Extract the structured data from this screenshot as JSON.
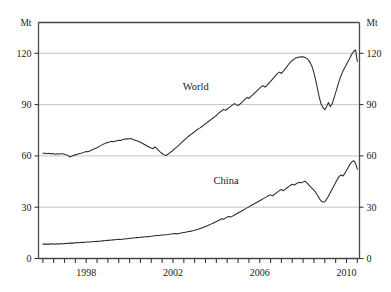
{
  "chart_data": {
    "type": "line",
    "title": "",
    "xlabel": "",
    "ylabel": "Mt",
    "unit_label_left": "Mt",
    "unit_label_right": "Mt",
    "grid": true,
    "legend": "inline-labels",
    "xlim": [
      1995.8,
      2010.6
    ],
    "ylim": [
      0,
      138
    ],
    "yticks": [
      0,
      30,
      60,
      90,
      120
    ],
    "ytick_labels": [
      "0",
      "30",
      "60",
      "90",
      "120"
    ],
    "xticks": [
      1996,
      1996.5,
      1997,
      1997.5,
      1998,
      1998.5,
      1999,
      1999.5,
      2000,
      2000.5,
      2001,
      2001.5,
      2002,
      2002.5,
      2003,
      2003.5,
      2004,
      2004.5,
      2005,
      2005.5,
      2006,
      2006.5,
      2007,
      2007.5,
      2008,
      2008.5,
      2009,
      2009.5,
      2010,
      2010.5
    ],
    "xtick_labels_shown": [
      "1998",
      "2002",
      "2006",
      "2010"
    ],
    "xtick_label_positions": [
      1998,
      2002,
      2006,
      2010
    ],
    "series": [
      {
        "name": "World",
        "label": "World",
        "label_x": 2003.05,
        "label_y": 98.5,
        "color": "#2b2b2b",
        "x": [
          1996.0,
          1996.083,
          1996.167,
          1996.25,
          1996.333,
          1996.417,
          1996.5,
          1996.583,
          1996.667,
          1996.75,
          1996.833,
          1996.917,
          1997.0,
          1997.083,
          1997.167,
          1997.25,
          1997.333,
          1997.417,
          1997.5,
          1997.583,
          1997.667,
          1997.75,
          1997.833,
          1997.917,
          1998.0,
          1998.083,
          1998.167,
          1998.25,
          1998.333,
          1998.417,
          1998.5,
          1998.583,
          1998.667,
          1998.75,
          1998.833,
          1998.917,
          1999.0,
          1999.083,
          1999.167,
          1999.25,
          1999.333,
          1999.417,
          1999.5,
          1999.583,
          1999.667,
          1999.75,
          1999.833,
          1999.917,
          2000.0,
          2000.083,
          2000.167,
          2000.25,
          2000.333,
          2000.417,
          2000.5,
          2000.583,
          2000.667,
          2000.75,
          2000.833,
          2000.917,
          2001.0,
          2001.083,
          2001.167,
          2001.25,
          2001.333,
          2001.417,
          2001.5,
          2001.583,
          2001.667,
          2001.75,
          2001.833,
          2001.917,
          2002.0,
          2002.083,
          2002.167,
          2002.25,
          2002.333,
          2002.417,
          2002.5,
          2002.583,
          2002.667,
          2002.75,
          2002.833,
          2002.917,
          2003.0,
          2003.083,
          2003.167,
          2003.25,
          2003.333,
          2003.417,
          2003.5,
          2003.583,
          2003.667,
          2003.75,
          2003.833,
          2003.917,
          2004.0,
          2004.083,
          2004.167,
          2004.25,
          2004.333,
          2004.417,
          2004.5,
          2004.583,
          2004.667,
          2004.75,
          2004.833,
          2004.917,
          2005.0,
          2005.083,
          2005.167,
          2005.25,
          2005.333,
          2005.417,
          2005.5,
          2005.583,
          2005.667,
          2005.75,
          2005.833,
          2005.917,
          2006.0,
          2006.083,
          2006.167,
          2006.25,
          2006.333,
          2006.417,
          2006.5,
          2006.583,
          2006.667,
          2006.75,
          2006.833,
          2006.917,
          2007.0,
          2007.083,
          2007.167,
          2007.25,
          2007.333,
          2007.417,
          2007.5,
          2007.583,
          2007.667,
          2007.75,
          2007.833,
          2007.917,
          2008.0,
          2008.083,
          2008.167,
          2008.25,
          2008.333,
          2008.417,
          2008.5,
          2008.583,
          2008.667,
          2008.75,
          2008.833,
          2008.917,
          2009.0,
          2009.083,
          2009.167,
          2009.25,
          2009.333,
          2009.417,
          2009.5,
          2009.583,
          2009.667,
          2009.75,
          2009.833,
          2009.917,
          2010.0,
          2010.083,
          2010.167,
          2010.25,
          2010.333,
          2010.417,
          2010.5
        ],
        "values": [
          61.5,
          61.6,
          61.3,
          61.5,
          61.2,
          61.4,
          61.3,
          61.0,
          61.2,
          61.1,
          61.3,
          61.2,
          61.0,
          60.6,
          60.2,
          59.4,
          59.8,
          60.3,
          60.6,
          60.9,
          61.3,
          61.5,
          61.8,
          62.2,
          62.6,
          62.4,
          62.9,
          63.4,
          63.9,
          64.3,
          64.8,
          65.4,
          66.0,
          66.6,
          67.1,
          67.6,
          67.9,
          68.1,
          68.5,
          68.3,
          68.6,
          68.9,
          69.2,
          69.0,
          69.4,
          69.7,
          70.0,
          69.8,
          70.2,
          70.0,
          69.6,
          69.2,
          68.8,
          68.4,
          68.0,
          67.4,
          66.8,
          66.2,
          65.6,
          65.1,
          64.6,
          64.2,
          65.2,
          64.4,
          63.2,
          62.2,
          61.4,
          60.6,
          60.2,
          60.8,
          61.6,
          62.4,
          63.3,
          64.2,
          65.1,
          66.0,
          67.0,
          68.0,
          69.0,
          70.0,
          71.0,
          71.8,
          72.6,
          73.4,
          74.2,
          75.0,
          75.8,
          76.4,
          77.2,
          78.0,
          78.8,
          79.6,
          80.4,
          81.2,
          82.0,
          82.8,
          83.6,
          84.8,
          85.6,
          86.4,
          87.2,
          86.6,
          87.4,
          88.2,
          89.0,
          89.8,
          90.6,
          90.0,
          89.4,
          90.2,
          91.2,
          92.2,
          93.2,
          94.2,
          93.6,
          94.6,
          95.6,
          96.6,
          97.6,
          98.6,
          99.6,
          100.6,
          101.0,
          100.2,
          101.2,
          102.4,
          103.6,
          104.8,
          106.0,
          107.2,
          108.4,
          109.0,
          108.2,
          109.4,
          110.8,
          112.2,
          113.6,
          114.8,
          115.8,
          116.6,
          117.2,
          117.6,
          117.8,
          117.9,
          118.0,
          117.6,
          117.0,
          116.0,
          114.4,
          112.0,
          108.6,
          104.2,
          99.0,
          94.0,
          90.2,
          88.2,
          87.0,
          88.8,
          91.2,
          88.8,
          90.2,
          93.5,
          97.0,
          100.5,
          104.0,
          107.0,
          109.5,
          111.5,
          113.5,
          115.5,
          117.5,
          119.6,
          121.2,
          122.0,
          115.2
        ]
      },
      {
        "name": "China",
        "label": "China",
        "label_x": 2004.45,
        "label_y": 43.5,
        "color": "#2b2b2b",
        "x": [
          1996.0,
          1996.083,
          1996.167,
          1996.25,
          1996.333,
          1996.417,
          1996.5,
          1996.583,
          1996.667,
          1996.75,
          1996.833,
          1996.917,
          1997.0,
          1997.083,
          1997.167,
          1997.25,
          1997.333,
          1997.417,
          1997.5,
          1997.583,
          1997.667,
          1997.75,
          1997.833,
          1997.917,
          1998.0,
          1998.083,
          1998.167,
          1998.25,
          1998.333,
          1998.417,
          1998.5,
          1998.583,
          1998.667,
          1998.75,
          1998.833,
          1998.917,
          1999.0,
          1999.083,
          1999.167,
          1999.25,
          1999.333,
          1999.417,
          1999.5,
          1999.583,
          1999.667,
          1999.75,
          1999.833,
          1999.917,
          2000.0,
          2000.083,
          2000.167,
          2000.25,
          2000.333,
          2000.417,
          2000.5,
          2000.583,
          2000.667,
          2000.75,
          2000.833,
          2000.917,
          2001.0,
          2001.083,
          2001.167,
          2001.25,
          2001.333,
          2001.417,
          2001.5,
          2001.583,
          2001.667,
          2001.75,
          2001.833,
          2001.917,
          2002.0,
          2002.083,
          2002.167,
          2002.25,
          2002.333,
          2002.417,
          2002.5,
          2002.583,
          2002.667,
          2002.75,
          2002.833,
          2002.917,
          2003.0,
          2003.083,
          2003.167,
          2003.25,
          2003.333,
          2003.417,
          2003.5,
          2003.583,
          2003.667,
          2003.75,
          2003.833,
          2003.917,
          2004.0,
          2004.083,
          2004.167,
          2004.25,
          2004.333,
          2004.417,
          2004.5,
          2004.583,
          2004.667,
          2004.75,
          2004.833,
          2004.917,
          2005.0,
          2005.083,
          2005.167,
          2005.25,
          2005.333,
          2005.417,
          2005.5,
          2005.583,
          2005.667,
          2005.75,
          2005.833,
          2005.917,
          2006.0,
          2006.083,
          2006.167,
          2006.25,
          2006.333,
          2006.417,
          2006.5,
          2006.583,
          2006.667,
          2006.75,
          2006.833,
          2006.917,
          2007.0,
          2007.083,
          2007.167,
          2007.25,
          2007.333,
          2007.417,
          2007.5,
          2007.583,
          2007.667,
          2007.75,
          2007.833,
          2007.917,
          2008.0,
          2008.083,
          2008.167,
          2008.25,
          2008.333,
          2008.417,
          2008.5,
          2008.583,
          2008.667,
          2008.75,
          2008.833,
          2008.917,
          2009.0,
          2009.083,
          2009.167,
          2009.25,
          2009.333,
          2009.417,
          2009.5,
          2009.583,
          2009.667,
          2009.75,
          2009.833,
          2009.917,
          2010.0,
          2010.083,
          2010.167,
          2010.25,
          2010.333,
          2010.417,
          2010.5
        ],
        "values": [
          8.4,
          8.5,
          8.4,
          8.5,
          8.4,
          8.6,
          8.5,
          8.4,
          8.6,
          8.5,
          8.7,
          8.6,
          8.7,
          8.9,
          8.8,
          9.0,
          9.1,
          9.0,
          9.2,
          9.3,
          9.2,
          9.4,
          9.5,
          9.4,
          9.6,
          9.7,
          9.6,
          9.8,
          9.9,
          10.0,
          10.1,
          10.0,
          10.2,
          10.3,
          10.4,
          10.5,
          10.6,
          10.7,
          10.8,
          10.9,
          11.0,
          11.1,
          11.2,
          11.1,
          11.3,
          11.4,
          11.5,
          11.6,
          11.8,
          11.9,
          12.0,
          12.1,
          12.2,
          12.3,
          12.4,
          12.5,
          12.6,
          12.7,
          12.8,
          12.9,
          13.0,
          13.2,
          13.3,
          13.4,
          13.5,
          13.6,
          13.7,
          13.8,
          13.9,
          14.0,
          14.2,
          14.3,
          14.5,
          14.6,
          14.4,
          14.6,
          14.8,
          15.0,
          15.2,
          15.4,
          15.6,
          15.8,
          16.0,
          16.2,
          16.5,
          16.8,
          17.1,
          17.5,
          17.9,
          18.3,
          18.7,
          19.1,
          19.6,
          20.1,
          20.6,
          21.1,
          21.6,
          22.1,
          22.7,
          23.3,
          23.0,
          23.6,
          24.2,
          24.6,
          24.2,
          24.8,
          25.4,
          26.0,
          26.6,
          27.2,
          27.8,
          28.4,
          29.0,
          29.6,
          30.2,
          30.8,
          31.4,
          32.0,
          32.6,
          33.2,
          33.8,
          34.4,
          35.0,
          35.6,
          36.2,
          36.8,
          37.2,
          36.6,
          37.4,
          38.2,
          39.0,
          39.8,
          40.4,
          39.6,
          40.4,
          41.2,
          42.0,
          42.8,
          43.4,
          43.0,
          43.6,
          44.2,
          44.6,
          44.2,
          44.8,
          45.2,
          44.4,
          43.2,
          42.0,
          41.0,
          40.0,
          38.6,
          36.8,
          35.0,
          33.6,
          33.0,
          33.2,
          34.6,
          36.4,
          38.4,
          40.4,
          42.4,
          44.4,
          46.4,
          48.0,
          48.8,
          48.2,
          49.6,
          51.4,
          53.4,
          55.2,
          56.6,
          57.2,
          55.8,
          52.2
        ]
      }
    ]
  }
}
